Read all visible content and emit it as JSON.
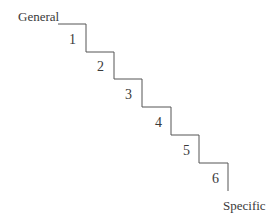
{
  "diagram": {
    "type": "staircase",
    "top_label": "General",
    "bottom_label": "Specific",
    "steps": [
      "1",
      "2",
      "3",
      "4",
      "5",
      "6"
    ],
    "line_color": "#555555"
  }
}
